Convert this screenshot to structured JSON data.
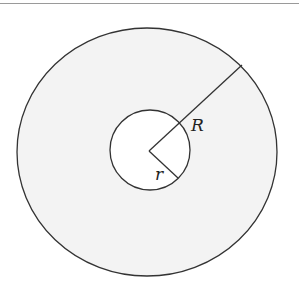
{
  "diagram": {
    "type": "annulus",
    "outer_circle": {
      "cx": 147,
      "cy": 152,
      "rx": 130,
      "ry": 124,
      "fill": "#f3f3f3",
      "stroke": "#333333"
    },
    "inner_circle": {
      "cx": 150,
      "cy": 150,
      "r": 40,
      "fill": "#ffffff",
      "stroke": "#333333"
    },
    "center": {
      "x": 149,
      "y": 151
    },
    "radius_lines": [
      {
        "name": "outer-radius",
        "to": {
          "x": 242,
          "y": 65
        }
      },
      {
        "name": "inner-radius",
        "to": {
          "x": 178,
          "y": 178
        }
      }
    ],
    "labels": {
      "outer_radius": "R",
      "inner_radius": "r"
    }
  }
}
